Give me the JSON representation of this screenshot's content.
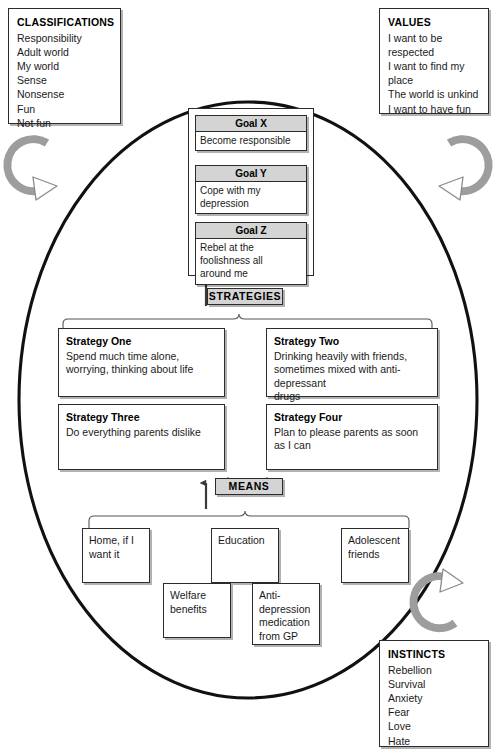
{
  "classifications": {
    "heading": "CLASSIFICATIONS",
    "items": [
      "Responsibility",
      "Adult world",
      "My world",
      "Sense",
      "Nonsense",
      "Fun",
      "Not fun"
    ]
  },
  "values": {
    "heading": "VALUES",
    "items": [
      "I want to be\nrespected",
      "I want to find my\nplace",
      "The world is unkind",
      "I want to have fun"
    ]
  },
  "instincts": {
    "heading": "INSTINCTS",
    "items": [
      "Rebellion",
      "Survival",
      "Anxiety",
      "Fear",
      "Love",
      "Hate"
    ]
  },
  "goals": [
    {
      "label": "Goal X",
      "text": "Become responsible"
    },
    {
      "label": "Goal Y",
      "text": "Cope with my\ndepression"
    },
    {
      "label": "Goal Z",
      "text": "Rebel at the\nfoolishness all\naround me"
    }
  ],
  "strategies_label": "STRATEGIES",
  "strategies": [
    {
      "title": "Strategy One",
      "text": "Spend much time alone,\nworrying, thinking about life"
    },
    {
      "title": "Strategy Two",
      "text": "Drinking heavily with friends,\nsometimes mixed with anti-depressant\ndrugs"
    },
    {
      "title": "Strategy Three",
      "text": "Do everything parents dislike"
    },
    {
      "title": "Strategy Four",
      "text": "Plan to please parents as soon\nas I can"
    }
  ],
  "means_label": "MEANS",
  "means": [
    {
      "text": "Home, if I\nwant it"
    },
    {
      "text": "Education"
    },
    {
      "text": "Adolescent\nfriends"
    },
    {
      "text": "Welfare\nbenefits"
    },
    {
      "text": "Anti-\ndepression\nmedication\nfrom GP"
    }
  ],
  "colors": {
    "outline": "#2b2b2b",
    "chip_fill": "#d4d4d4",
    "goal_head_fill": "#d4d4d4",
    "arrow_fill": "#b5b5b5",
    "page_background": "#ffffff"
  },
  "icons": {
    "cycle_arrow_top_left": "curved-arrow-icon",
    "cycle_arrow_top_right": "curved-arrow-icon",
    "cycle_arrow_bottom_right": "curved-arrow-icon"
  }
}
